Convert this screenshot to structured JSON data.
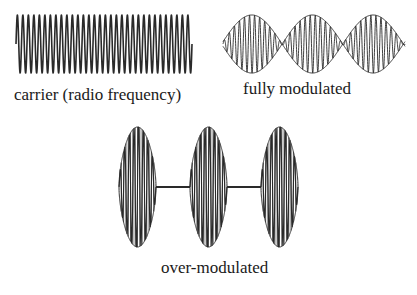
{
  "diagram": {
    "colors": {
      "stroke": "#2a2a2a",
      "background": "#ffffff"
    },
    "panels": [
      {
        "id": "carrier",
        "label": "carrier (radio frequency)",
        "type": "constant",
        "box": {
          "x": 16,
          "y": 15,
          "w": 176,
          "h": 58
        },
        "cycles": 32
      },
      {
        "id": "full",
        "label": "fully modulated",
        "type": "full",
        "box": {
          "x": 223,
          "y": 15,
          "w": 182,
          "h": 58
        },
        "lobes": 3,
        "cycles_per_lobe": 6
      },
      {
        "id": "over",
        "label": "over-modulated",
        "type": "over",
        "box": {
          "x": 119,
          "y": 127,
          "w": 196,
          "h": 120
        },
        "lobes": 3,
        "cycles_per_lobe": 8,
        "lobe_width": 37,
        "gap_width": 34
      }
    ]
  }
}
